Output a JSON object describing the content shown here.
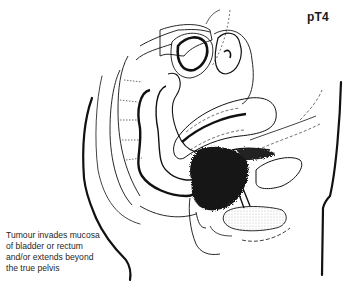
{
  "figure": {
    "type": "anatomical-illustration",
    "stage_label": "pT4",
    "caption_lines": [
      "Tumour invades mucosa",
      "of bladder or rectum",
      "and/or extends beyond",
      "the true pelvis"
    ],
    "colors": {
      "line": "#111111",
      "tumour": "#151515",
      "stipple": "#d8d8d8",
      "background": "#ffffff"
    }
  }
}
